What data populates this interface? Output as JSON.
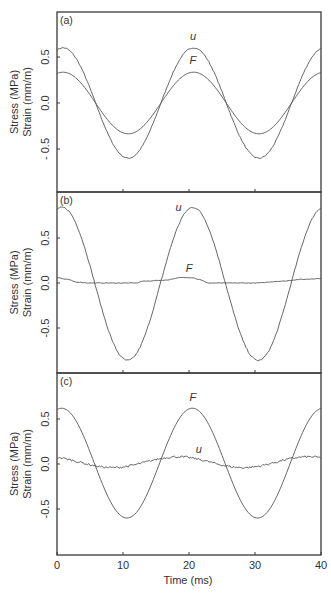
{
  "chart_data": [
    {
      "type": "line",
      "panel": "(a)",
      "xlabel": "",
      "ylabel": [
        "Stress (MPa)",
        "Strain (mm/m)"
      ],
      "xlim": [
        0,
        40
      ],
      "ylim": [
        -0.97,
        0.98
      ],
      "yticks": [
        0.5,
        0.0,
        -0.5
      ],
      "ytick_labels": [
        "0.5",
        "0.0",
        "- 0.5"
      ],
      "xticks": [
        10,
        20,
        30
      ],
      "grid": false,
      "series": [
        {
          "name": "u",
          "label_at": {
            "x": 20.6,
            "y": 0.68
          },
          "model": {
            "amp": 0.6,
            "offset": 0.0,
            "period": 19.8,
            "phase_peak": 0.9
          },
          "peaks": [
            {
              "x": 0.9,
              "y": 0.6
            },
            {
              "x": 20.6,
              "y": 0.6
            }
          ],
          "troughs": [
            {
              "x": 10.6,
              "y": -0.59
            },
            {
              "x": 30.5,
              "y": -0.6
            }
          ],
          "noise": 0.006
        },
        {
          "name": "F",
          "label_at": {
            "x": 20.6,
            "y": 0.42
          },
          "model": {
            "amp": 0.335,
            "offset": 0.0,
            "period": 19.8,
            "phase_peak": 0.9
          },
          "peaks": [
            {
              "x": 0.9,
              "y": 0.34
            },
            {
              "x": 20.6,
              "y": 0.34
            }
          ],
          "troughs": [
            {
              "x": 10.6,
              "y": -0.32
            },
            {
              "x": 30.5,
              "y": -0.33
            }
          ],
          "noise": 0.0
        }
      ]
    },
    {
      "type": "line",
      "panel": "(b)",
      "xlabel": "",
      "ylabel": [
        "Stress (MPa)",
        "Strain (mm/m)"
      ],
      "xlim": [
        0,
        40
      ],
      "ylim": [
        -1.0,
        1.01
      ],
      "yticks": [
        0.5,
        0.0,
        -0.5
      ],
      "ytick_labels": [
        "0.5",
        "0.0",
        "-0.5"
      ],
      "xticks": [
        10,
        20,
        30
      ],
      "grid": false,
      "series": [
        {
          "name": "u",
          "label_at": {
            "x": 18.4,
            "y": 0.8
          },
          "model": {
            "amp": 0.85,
            "offset": -0.01,
            "period": 19.8,
            "phase_peak": 0.8
          },
          "peaks": [
            {
              "x": 0.5,
              "y": 0.84
            },
            {
              "x": 20.6,
              "y": 0.84
            }
          ],
          "troughs": [
            {
              "x": 10.3,
              "y": -0.87
            },
            {
              "x": 30.3,
              "y": -0.87
            }
          ],
          "noise": 0.008
        },
        {
          "name": "F",
          "label_at": {
            "x": 20.0,
            "y": 0.12
          },
          "model": {
            "amp": 0.0,
            "offset": 0.03,
            "period": 19.8,
            "phase_peak": 0.8
          },
          "points": [
            [
              0,
              0.06
            ],
            [
              1.5,
              0.04
            ],
            [
              3,
              0.01
            ],
            [
              5,
              0.0
            ],
            [
              9,
              0.0
            ],
            [
              12,
              0.0
            ],
            [
              13,
              0.02
            ],
            [
              16,
              0.03
            ],
            [
              19,
              0.06
            ],
            [
              20.5,
              0.06
            ],
            [
              21.5,
              0.04
            ],
            [
              23,
              0.0
            ],
            [
              26,
              0.0
            ],
            [
              30,
              0.0
            ],
            [
              34,
              0.02
            ],
            [
              37,
              0.04
            ],
            [
              40,
              0.05
            ]
          ],
          "noise": 0.003
        }
      ]
    },
    {
      "type": "line",
      "panel": "(c)",
      "xlabel": "Time (ms)",
      "ylabel": [
        "Stress (MPa)",
        "Strain (mm/m)"
      ],
      "xlim": [
        0,
        40
      ],
      "ylim": [
        -1.0,
        1.01
      ],
      "yticks": [
        0.5,
        0.0,
        -0.5
      ],
      "ytick_labels": [
        "0.5",
        "0.0",
        "-0.5"
      ],
      "xticks": [
        0,
        10,
        20,
        30,
        40
      ],
      "xtick_labels": [
        "0",
        "10",
        "20",
        "30",
        "40"
      ],
      "grid": false,
      "series": [
        {
          "name": "F",
          "label_at": {
            "x": 20.6,
            "y": 0.7
          },
          "model": {
            "amp": 0.61,
            "offset": 0.01,
            "period": 19.8,
            "phase_peak": 0.7
          },
          "peaks": [
            {
              "x": 0.7,
              "y": 0.62
            },
            {
              "x": 20.4,
              "y": 0.62
            }
          ],
          "troughs": [
            {
              "x": 10.5,
              "y": -0.59
            },
            {
              "x": 30.3,
              "y": -0.59
            }
          ],
          "noise": 0.0
        },
        {
          "name": "u",
          "label_at": {
            "x": 21.5,
            "y": 0.12
          },
          "model": {
            "amp": 0.06,
            "offset": 0.02,
            "period": 19.8,
            "phase_peak": 18.3
          },
          "peaks": [
            {
              "x": 18.3,
              "y": 0.08
            },
            {
              "x": 38.2,
              "y": 0.08
            }
          ],
          "troughs": [
            {
              "x": 8.3,
              "y": -0.04
            },
            {
              "x": 28.2,
              "y": -0.04
            }
          ],
          "noise": 0.012
        }
      ]
    }
  ],
  "figure": {
    "panel_labels": [
      "(a)",
      "(b)",
      "(c)"
    ],
    "xlabel": "Time (ms)",
    "ylabel_line1": "Stress (MPa)",
    "ylabel_line2": "Strain (mm/m)",
    "line_color": "#555555",
    "frame_color": "#3a3a3a"
  }
}
